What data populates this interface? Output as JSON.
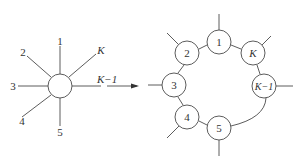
{
  "left_diagram": {
    "center_node": "",
    "legs": [
      {
        "label": "1",
        "italic": false
      },
      {
        "label": "2",
        "italic": false
      },
      {
        "label": "3",
        "italic": false
      },
      {
        "label": "4",
        "italic": false
      },
      {
        "label": "5",
        "italic": false
      },
      {
        "label": "K",
        "italic": true
      },
      {
        "label": "K−1",
        "italic": true
      }
    ]
  },
  "arrow": {
    "direction": "right"
  },
  "right_diagram": {
    "nodes": [
      {
        "label": "1"
      },
      {
        "label": "2"
      },
      {
        "label": "3"
      },
      {
        "label": "4"
      },
      {
        "label": "5"
      },
      {
        "label": "K"
      },
      {
        "label": "K−1"
      }
    ]
  }
}
